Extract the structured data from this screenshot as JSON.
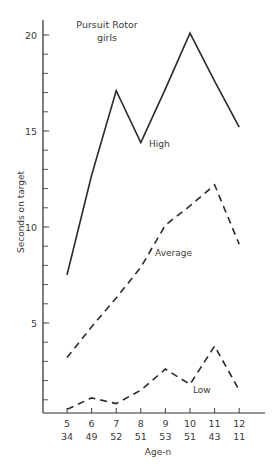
{
  "chart_data": {
    "type": "line",
    "title": "Pursuit Rotor",
    "subtitle": "girls",
    "xlabel": "Age-n",
    "ylabel": "Seconds on target",
    "x": [
      5,
      6,
      7,
      8,
      9,
      10,
      11,
      12
    ],
    "n": [
      34,
      49,
      52,
      51,
      53,
      51,
      43,
      11
    ],
    "ylim": [
      0.3,
      20.8
    ],
    "yticks_major": [
      5,
      10,
      15,
      20
    ],
    "yticks_minor": [
      1,
      2,
      3,
      4,
      6,
      7,
      8,
      9,
      11,
      12,
      13,
      14,
      16,
      17,
      18,
      19
    ],
    "grid": false,
    "legend": "inline labels",
    "series": [
      {
        "name": "High",
        "style": "solid",
        "values": [
          7.5,
          12.7,
          17.1,
          14.4,
          17.2,
          20.1,
          17.6,
          15.2
        ]
      },
      {
        "name": "Average",
        "style": "dashed",
        "values": [
          3.2,
          4.8,
          6.3,
          7.9,
          10.1,
          11.1,
          12.2,
          9.1
        ]
      },
      {
        "name": "Low",
        "style": "dashed",
        "values": [
          0.5,
          1.1,
          0.8,
          1.5,
          2.6,
          1.8,
          3.8,
          1.5
        ]
      }
    ],
    "annotations": [
      {
        "text": "High",
        "series": "High"
      },
      {
        "text": "Average",
        "series": "Average"
      },
      {
        "text": "Low",
        "series": "Low"
      }
    ]
  },
  "colors": {
    "line": "#2a2a2a",
    "text": "#3a3a3a",
    "background": "#ffffff"
  }
}
